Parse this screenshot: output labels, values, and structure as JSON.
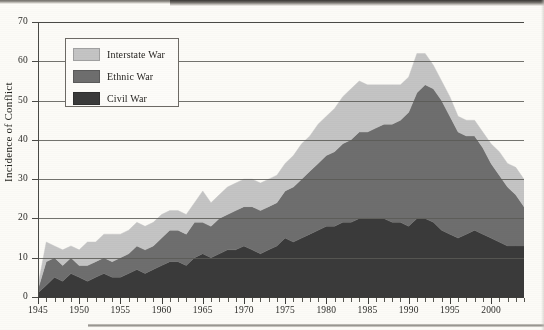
{
  "figure": {
    "background_color": "#fcfbf7",
    "page_type": "scanned-book-page"
  },
  "legend": {
    "position": "top-left-inside",
    "items": [
      {
        "label": "Interstate War",
        "color": "#c4c4c4",
        "swatch_name": "interstate-war-swatch"
      },
      {
        "label": "Ethnic War",
        "color": "#6e6e6e",
        "swatch_name": "ethnic-war-swatch"
      },
      {
        "label": "Civil War",
        "color": "#3a3a3a",
        "swatch_name": "civil-war-swatch"
      }
    ]
  },
  "axes": {
    "y_title": "Incidence of Conflict",
    "y_ticks": [
      0,
      10,
      20,
      30,
      40,
      50,
      60,
      70
    ],
    "y_min": 0,
    "y_max": 70,
    "x_ticks_major": [
      1945,
      1950,
      1955,
      1960,
      1965,
      1970,
      1975,
      1980,
      1985,
      1990,
      1995,
      2000
    ],
    "x_min": 1945,
    "x_max": 2004,
    "x_minor_step": 1,
    "grid": "horizontal-only"
  },
  "chart_data": {
    "type": "area",
    "stacked": true,
    "title": "",
    "xlabel": "",
    "ylabel": "Incidence of Conflict",
    "ylim": [
      0,
      70
    ],
    "xlim": [
      1945,
      2004
    ],
    "grid": true,
    "legend_position": "upper left",
    "x": [
      1945,
      1946,
      1947,
      1948,
      1949,
      1950,
      1951,
      1952,
      1953,
      1954,
      1955,
      1956,
      1957,
      1958,
      1959,
      1960,
      1961,
      1962,
      1963,
      1964,
      1965,
      1966,
      1967,
      1968,
      1969,
      1970,
      1971,
      1972,
      1973,
      1974,
      1975,
      1976,
      1977,
      1978,
      1979,
      1980,
      1981,
      1982,
      1983,
      1984,
      1985,
      1986,
      1987,
      1988,
      1989,
      1990,
      1991,
      1992,
      1993,
      1994,
      1995,
      1996,
      1997,
      1998,
      1999,
      2000,
      2001,
      2002,
      2003,
      2004
    ],
    "series": [
      {
        "name": "Civil War",
        "color": "#3a3a3a",
        "values": [
          1,
          3,
          5,
          4,
          6,
          5,
          4,
          5,
          6,
          5,
          5,
          6,
          7,
          6,
          7,
          8,
          9,
          9,
          8,
          10,
          11,
          10,
          11,
          12,
          12,
          13,
          12,
          11,
          12,
          13,
          15,
          14,
          15,
          16,
          17,
          18,
          18,
          19,
          19,
          20,
          20,
          20,
          20,
          19,
          19,
          18,
          20,
          20,
          19,
          17,
          16,
          15,
          16,
          17,
          16,
          15,
          14,
          13,
          13,
          13
        ]
      },
      {
        "name": "Ethnic War",
        "color": "#6e6e6e",
        "values": [
          1,
          6,
          5,
          4,
          4,
          3,
          4,
          4,
          4,
          4,
          5,
          5,
          6,
          6,
          6,
          7,
          8,
          8,
          8,
          9,
          8,
          8,
          9,
          9,
          10,
          10,
          11,
          11,
          11,
          11,
          12,
          14,
          15,
          16,
          17,
          18,
          19,
          20,
          21,
          22,
          22,
          23,
          24,
          25,
          26,
          29,
          32,
          34,
          34,
          33,
          30,
          27,
          25,
          24,
          22,
          19,
          17,
          15,
          13,
          10
        ]
      },
      {
        "name": "Interstate War",
        "color": "#c4c4c4",
        "values": [
          1,
          5,
          3,
          4,
          3,
          4,
          6,
          5,
          6,
          7,
          6,
          6,
          6,
          6,
          6,
          6,
          5,
          5,
          5,
          5,
          8,
          6,
          6,
          7,
          7,
          7,
          7,
          7,
          7,
          7,
          7,
          8,
          9,
          9,
          10,
          10,
          11,
          12,
          13,
          13,
          12,
          11,
          10,
          10,
          9,
          9,
          10,
          8,
          6,
          5,
          5,
          4,
          4,
          4,
          4,
          5,
          6,
          6,
          7,
          7
        ]
      }
    ]
  }
}
